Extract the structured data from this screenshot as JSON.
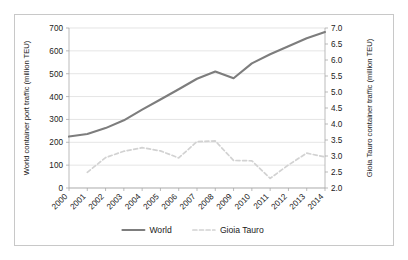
{
  "chart_data": {
    "type": "line",
    "title": "",
    "xlabel": "",
    "categories": [
      "2000",
      "2001",
      "2002",
      "2003",
      "2004",
      "2005",
      "2006",
      "2007",
      "2008",
      "2009",
      "2010",
      "2011",
      "2012",
      "2013",
      "2014"
    ],
    "grid": true,
    "legend_position": "bottom-center",
    "series": [
      {
        "name": "World",
        "axis": "left",
        "ylabel": "World container port traffic (million TEU)",
        "ylim": [
          0,
          700
        ],
        "ytick_step": 100,
        "yticks": [
          "0",
          "100",
          "200",
          "300",
          "400",
          "500",
          "600",
          "700"
        ],
        "color": "#7d7d7d",
        "style": "solid",
        "values": [
          225,
          236,
          262,
          296,
          343,
          387,
          432,
          478,
          510,
          480,
          545,
          585,
          620,
          655,
          682
        ]
      },
      {
        "name": "Gioia Tauro",
        "axis": "right",
        "ylabel": "Gioia Tauro container traffic (million TEU)",
        "ylim": [
          2.0,
          7.0
        ],
        "ytick_step": 0.5,
        "yticks": [
          "2.0",
          "2.5",
          "3.0",
          "3.5",
          "4.0",
          "4.5",
          "5.0",
          "5.5",
          "6.0",
          "6.5",
          "7.0"
        ],
        "color": "#d2d2d2",
        "style": "dashed",
        "values": [
          null,
          2.49,
          2.95,
          3.15,
          3.26,
          3.16,
          2.94,
          3.45,
          3.47,
          2.86,
          2.85,
          2.3,
          2.72,
          3.09,
          2.97
        ]
      }
    ]
  },
  "axes": {
    "left_title": "World container port traffic (million TEU)",
    "right_title": "Gioia Tauro container traffic (million TEU)"
  },
  "legend": {
    "items": [
      {
        "label": "World",
        "swatch": "solid-line-swatch"
      },
      {
        "label": "Gioia Tauro",
        "swatch": "dashed-line-swatch"
      }
    ]
  }
}
